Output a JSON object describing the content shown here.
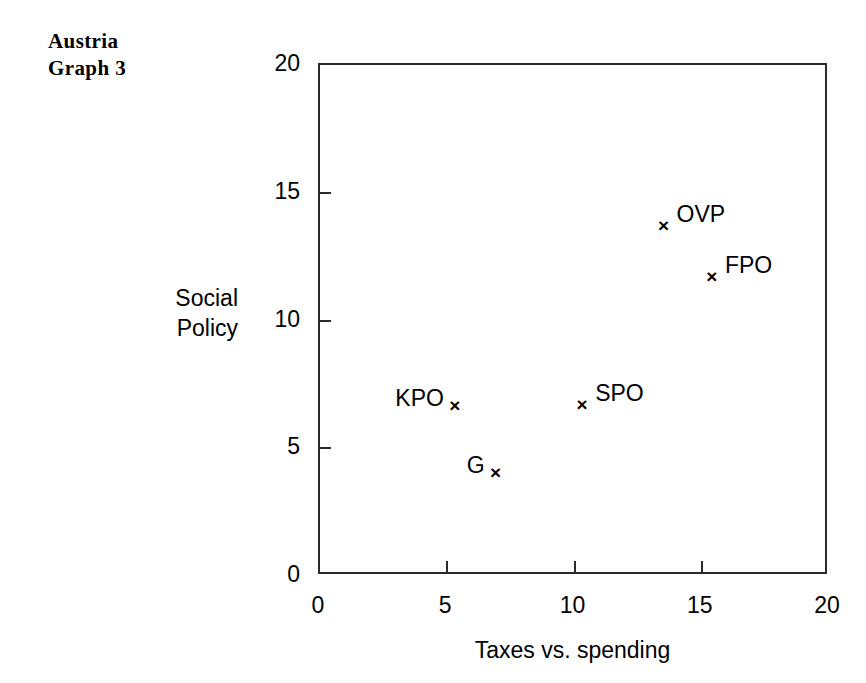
{
  "figure": {
    "title_lines": [
      "Austria",
      "Graph 3"
    ]
  },
  "chart_data": {
    "type": "scatter",
    "title": "Austria Graph 3",
    "xlabel": "Taxes vs. spending",
    "ylabel": "Social Policy",
    "ylabel_lines": [
      "Social",
      "Policy"
    ],
    "xlim": [
      0,
      20
    ],
    "ylim": [
      0,
      20
    ],
    "xticks": [
      0,
      5,
      10,
      15,
      20
    ],
    "yticks": [
      0,
      5,
      10,
      15,
      20
    ],
    "xtick_labels": [
      "0",
      "5",
      "10",
      "15",
      "20"
    ],
    "ytick_labels": [
      "0",
      "5",
      "10",
      "15",
      "20"
    ],
    "grid": false,
    "legend": "none",
    "marker": "x",
    "points": [
      {
        "label": "KPO",
        "x": 5.3,
        "y": 6.6,
        "label_pos": "left"
      },
      {
        "label": "G",
        "x": 6.9,
        "y": 4.0,
        "label_pos": "left"
      },
      {
        "label": "SPO",
        "x": 10.3,
        "y": 6.65,
        "label_pos": "right"
      },
      {
        "label": "OVP",
        "x": 13.5,
        "y": 13.65,
        "label_pos": "right"
      },
      {
        "label": "FPO",
        "x": 15.4,
        "y": 11.65,
        "label_pos": "right"
      }
    ],
    "colors": {
      "marker": "#000000",
      "axis": "#2b2b2b",
      "text": "#000000",
      "background": "#ffffff"
    }
  }
}
